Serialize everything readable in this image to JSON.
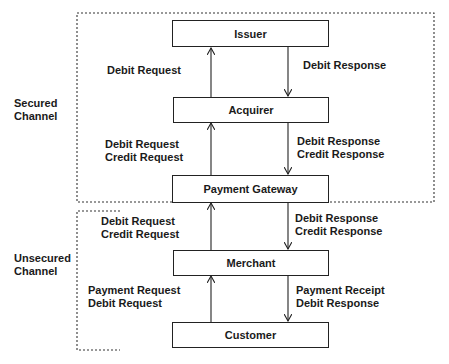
{
  "channels": {
    "secured": {
      "label_line1": "Secured",
      "label_line2": "Channel"
    },
    "unsecured": {
      "label_line1": "Unsecured",
      "label_line2": "Channel"
    }
  },
  "nodes": {
    "issuer": "Issuer",
    "acquirer": "Acquirer",
    "gateway": "Payment Gateway",
    "merchant": "Merchant",
    "customer": "Customer"
  },
  "flows": {
    "acquirer_to_issuer": {
      "line1": "Debit Request"
    },
    "issuer_to_acquirer": {
      "line1": "Debit Response"
    },
    "gateway_to_acquirer": {
      "line1": "Debit Request",
      "line2": "Credit Request"
    },
    "acquirer_to_gateway": {
      "line1": "Debit Response",
      "line2": "Credit Response"
    },
    "merchant_to_gateway": {
      "line1": "Debit Request",
      "line2": "Credit Request"
    },
    "gateway_to_merchant": {
      "line1": "Debit Response",
      "line2": "Credit Response"
    },
    "customer_to_merchant": {
      "line1": "Payment Request",
      "line2": "Debit Request"
    },
    "merchant_to_customer": {
      "line1": "Payment Receipt",
      "line2": "Debit Response"
    }
  }
}
